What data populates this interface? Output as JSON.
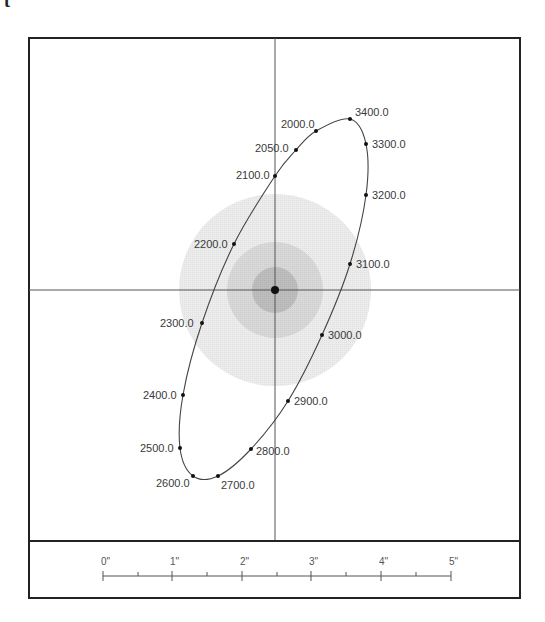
{
  "header": {
    "corner_glyph": "t"
  },
  "plot": {
    "frame": {
      "x": 29,
      "y": 38,
      "width": 491,
      "height": 503,
      "stroke": "#222222"
    },
    "crosshair": {
      "cx": 275,
      "cy": 290,
      "color": "#555555"
    },
    "rings": [
      {
        "name": "outer",
        "r": 96,
        "fill": "#ececec"
      },
      {
        "name": "middle",
        "r": 48,
        "fill": "#d8d8d8"
      },
      {
        "name": "inner",
        "r": 23,
        "fill": "#bdbdbd"
      }
    ],
    "center_dot": {
      "r": 4,
      "fill": "#111111"
    },
    "ellipse": {
      "cx": 274,
      "cy": 299,
      "rx": 78,
      "ry": 188,
      "rotate": 20,
      "stroke": "#444444"
    },
    "points": [
      {
        "label": "2000.0",
        "x": 316,
        "y": 131,
        "lx": 281,
        "ly": 128,
        "anchor": "start"
      },
      {
        "label": "2050.0",
        "x": 296,
        "y": 150,
        "lx": 255,
        "ly": 152,
        "anchor": "start"
      },
      {
        "label": "2100.0",
        "x": 275,
        "y": 176,
        "lx": 236,
        "ly": 179,
        "anchor": "start"
      },
      {
        "label": "2200.0",
        "x": 234,
        "y": 244,
        "lx": 194,
        "ly": 248,
        "anchor": "start"
      },
      {
        "label": "2300.0",
        "x": 202,
        "y": 323,
        "lx": 160,
        "ly": 327,
        "anchor": "start"
      },
      {
        "label": "2400.0",
        "x": 183,
        "y": 395,
        "lx": 143,
        "ly": 399,
        "anchor": "start"
      },
      {
        "label": "2500.0",
        "x": 180,
        "y": 448,
        "lx": 140,
        "ly": 452,
        "anchor": "start"
      },
      {
        "label": "2600.0",
        "x": 193,
        "y": 476,
        "lx": 156,
        "ly": 487,
        "anchor": "start"
      },
      {
        "label": "2700.0",
        "x": 218,
        "y": 476,
        "lx": 221,
        "ly": 489,
        "anchor": "start"
      },
      {
        "label": "2800.0",
        "x": 251,
        "y": 449,
        "lx": 256,
        "ly": 455,
        "anchor": "start"
      },
      {
        "label": "2900.0",
        "x": 288,
        "y": 401,
        "lx": 294,
        "ly": 405,
        "anchor": "start"
      },
      {
        "label": "3000.0",
        "x": 322,
        "y": 335,
        "lx": 328,
        "ly": 339,
        "anchor": "start"
      },
      {
        "label": "3100.0",
        "x": 350,
        "y": 264,
        "lx": 356,
        "ly": 268,
        "anchor": "start"
      },
      {
        "label": "3200.0",
        "x": 366,
        "y": 195,
        "lx": 372,
        "ly": 199,
        "anchor": "start"
      },
      {
        "label": "3300.0",
        "x": 366,
        "y": 144,
        "lx": 372,
        "ly": 148,
        "anchor": "start"
      },
      {
        "label": "3400.0",
        "x": 350,
        "y": 119,
        "lx": 355,
        "ly": 116,
        "anchor": "start"
      }
    ]
  },
  "scale_bar": {
    "frame": {
      "x": 29,
      "y": 541,
      "width": 491,
      "height": 57
    },
    "y": 576,
    "major_ticks": [
      {
        "label": "0\"",
        "x": 103
      },
      {
        "label": "1\"",
        "x": 172
      },
      {
        "label": "2\"",
        "x": 242
      },
      {
        "label": "3\"",
        "x": 311
      },
      {
        "label": "4\"",
        "x": 381
      },
      {
        "label": "5\"",
        "x": 451
      }
    ],
    "minor_ticks": [
      138,
      207,
      277,
      346,
      416
    ]
  }
}
